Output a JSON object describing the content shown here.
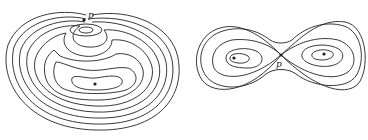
{
  "figures": [
    {
      "name": "left-contour-map",
      "saddle_label": "p",
      "description": "Nested closed contour lines around a minimum with a saddle point p near the top and a small closed contour below it"
    },
    {
      "name": "right-contour-map",
      "saddle_label": "p",
      "description": "Figure-eight contour lines around two extrema joined at a saddle point p"
    }
  ],
  "colors": {
    "line": "#222222",
    "background": "#ffffff"
  }
}
